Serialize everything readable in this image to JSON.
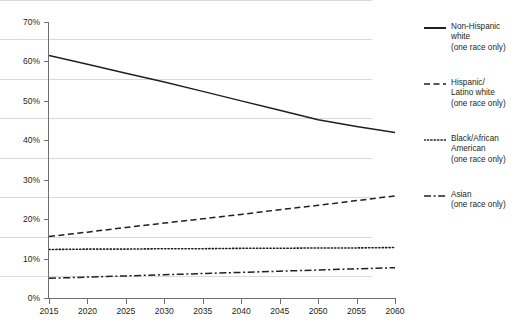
{
  "chart_data": {
    "type": "line",
    "title": "",
    "xlabel": "",
    "ylabel": "",
    "x": [
      2015,
      2020,
      2025,
      2030,
      2035,
      2040,
      2045,
      2050,
      2055,
      2060
    ],
    "xlim": [
      2015,
      2060
    ],
    "ylim": [
      0,
      70
    ],
    "ytick_labels": [
      "0%",
      "10%",
      "20%",
      "30%",
      "40%",
      "50%",
      "60%",
      "70%"
    ],
    "ytick_values": [
      0,
      10,
      20,
      30,
      40,
      50,
      60,
      70
    ],
    "xtick_labels": [
      "2015",
      "2020",
      "2025",
      "2030",
      "2035",
      "2040",
      "2045",
      "2050",
      "2055",
      "2060"
    ],
    "grid": "horizontal",
    "legend_position": "right",
    "series": [
      {
        "name": "Non-Hispanic white (one race only)",
        "legend_label": "Non-Hispanic\nwhite\n(one race only)",
        "style": "solid",
        "color": "#231f20",
        "values": [
          61.5,
          59.3,
          57.0,
          54.8,
          52.4,
          50.0,
          47.6,
          45.2,
          43.5,
          42.0
        ]
      },
      {
        "name": "Hispanic/Latino white (one race only)",
        "legend_label": "Hispanic/\nLatino white\n(one race only)",
        "style": "dashed",
        "color": "#231f20",
        "values": [
          15.6,
          16.7,
          17.9,
          19.0,
          20.1,
          21.2,
          22.4,
          23.5,
          24.7,
          25.9
        ]
      },
      {
        "name": "Black/African American (one race only)",
        "legend_label": "Black/African\nAmerican\n(one race only)",
        "style": "dotted",
        "color": "#231f20",
        "values": [
          12.3,
          12.4,
          12.4,
          12.5,
          12.5,
          12.6,
          12.6,
          12.7,
          12.7,
          12.8
        ]
      },
      {
        "name": "Asian (one race only)",
        "legend_label": "Asian\n(one race only)",
        "style": "dashdot",
        "color": "#231f20",
        "values": [
          5.0,
          5.3,
          5.6,
          5.9,
          6.2,
          6.5,
          6.8,
          7.1,
          7.4,
          7.7
        ]
      }
    ]
  },
  "axes": {
    "y_labels": [
      "70%",
      "60%",
      "50%",
      "40%",
      "30%",
      "20%",
      "10%",
      "0%"
    ],
    "x_labels": [
      "2015",
      "2020",
      "2025",
      "2030",
      "2035",
      "2040",
      "2045",
      "2050",
      "2055",
      "2060"
    ]
  },
  "legend": {
    "items": [
      {
        "label": "Non-Hispanic\nwhite\n(one race only)",
        "style": "solid"
      },
      {
        "label": "Hispanic/\nLatino white\n(one race only)",
        "style": "dashed"
      },
      {
        "label": "Black/African\nAmerican\n(one race only)",
        "style": "dotted"
      },
      {
        "label": "Asian\n(one race only)",
        "style": "dashdot"
      }
    ]
  }
}
